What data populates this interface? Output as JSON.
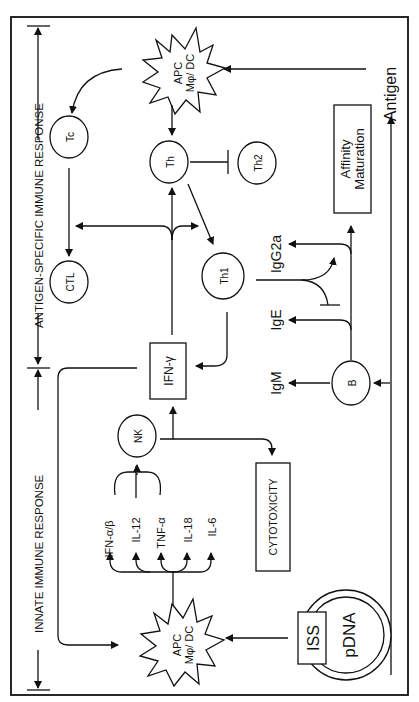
{
  "diagram": {
    "orientation": "rotated -90deg",
    "sections": {
      "innate": "INNATE IMMUNE RESPONSE",
      "specific": "ANTIGEN-SPECIFIC IMMUNE RESPONSE"
    },
    "nodes": {
      "pdna": "pDNA",
      "iss": "ISS",
      "apc_innate_line1": "APC",
      "apc_innate_line2": "Mφ/ DC",
      "apc_specific_line1": "APC",
      "apc_specific_line2": "Mφ/ DC",
      "nk": "NK",
      "ifn_gamma": "IFN-γ",
      "cytotoxicity": "CYTOTOXICITY",
      "b": "B",
      "tc": "Tc",
      "ctl": "CTL",
      "th": "Th",
      "th1": "Th1",
      "th2": "Th2",
      "affinity_line1": "Affinity",
      "affinity_line2": "Maturation",
      "antigen": "Antigen"
    },
    "cytokines": [
      "IFN-α/β",
      "IL-12",
      "TNF-α",
      "IL-18",
      "IL-6"
    ],
    "antibodies": {
      "igm": "IgM",
      "ige": "IgE",
      "igg2a": "IgG2a"
    },
    "edges": [
      {
        "from": "ISS",
        "to": "APC (innate)",
        "type": "activate"
      },
      {
        "from": "APC (innate)",
        "to": "IFN-α/β, IL-12, TNF-α, IL-18, IL-6",
        "type": "produce"
      },
      {
        "from": "IFN-α/β, IL-12, TNF-α",
        "to": "NK",
        "type": "activate"
      },
      {
        "from": "NK",
        "to": "IFN-γ",
        "type": "produce"
      },
      {
        "from": "NK",
        "to": "CYTOTOXICITY",
        "type": "produce"
      },
      {
        "from": "IFN-γ",
        "to": "APC (innate)",
        "type": "feedback"
      },
      {
        "from": "IFN-γ",
        "to": "Th, Th1, CTL",
        "type": "activate"
      },
      {
        "from": "Antigen",
        "to": "APC (specific)",
        "type": "present"
      },
      {
        "from": "Antigen",
        "to": "B",
        "type": "activate"
      },
      {
        "from": "APC (specific)",
        "to": "Tc",
        "type": "activate"
      },
      {
        "from": "APC (specific)",
        "to": "Th",
        "type": "activate"
      },
      {
        "from": "Tc",
        "to": "CTL",
        "type": "differentiate"
      },
      {
        "from": "Th",
        "to": "Th1",
        "type": "differentiate"
      },
      {
        "from": "Th",
        "to": "Th2",
        "type": "inhibit"
      },
      {
        "from": "Th1",
        "to": "IFN-γ",
        "type": "produce"
      },
      {
        "from": "Th1",
        "to": "IgG2a",
        "type": "promote"
      },
      {
        "from": "Th1",
        "to": "IgE",
        "type": "inhibit"
      },
      {
        "from": "B",
        "to": "IgM",
        "type": "produce"
      },
      {
        "from": "B",
        "to": "IgE",
        "type": "produce"
      },
      {
        "from": "B",
        "to": "IgG2a",
        "type": "produce"
      },
      {
        "from": "B",
        "to": "Affinity Maturation",
        "type": "undergo"
      }
    ]
  }
}
